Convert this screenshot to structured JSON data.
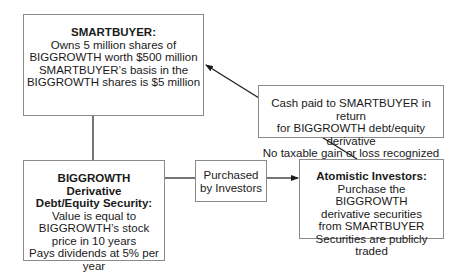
{
  "boxes": {
    "smartbuyer": {
      "title": "SMARTBUYER:",
      "lines": [
        "Owns 5 million shares of",
        "BIGGROWTH worth $500 million",
        "SMARTBUYER’s basis in the",
        "BIGGROWTH shares is $5 million"
      ]
    },
    "derivative": {
      "title_lines": [
        "BIGGROWTH",
        "Derivative",
        "Debt/Equity Security:"
      ],
      "lines": [
        "Value is equal to",
        "BIGGROWTH’s stock",
        "price in 10 years",
        "Pays dividends at 5% per year"
      ]
    },
    "purchased": {
      "lines": [
        "Purchased",
        "by Investors"
      ]
    },
    "cash": {
      "lines": [
        "Cash paid to SMARTBUYER in return",
        "for BIGGROWTH debt/equity derivative",
        "No taxable gain or loss recognized"
      ]
    },
    "investors": {
      "title": "Atomistic Investors:",
      "lines": [
        "Purchase the BIGGROWTH",
        "derivative securities",
        "from SMARTBUYER",
        "Securities are publicly traded"
      ]
    }
  },
  "colors": {
    "line": "#1a1a1a",
    "border": "#8a8a8a"
  }
}
